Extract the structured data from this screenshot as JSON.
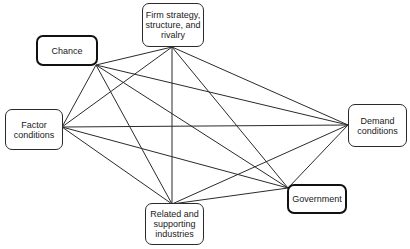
{
  "diagram": {
    "type": "network",
    "title": "",
    "nodes": [
      {
        "id": "chance",
        "label": "Chance",
        "x": 36,
        "y": 35,
        "w": 62,
        "h": 31,
        "emphasis": true
      },
      {
        "id": "firm",
        "label": "Firm strategy,\nstructure, and\nrivalry",
        "x": 142,
        "y": 3,
        "w": 62,
        "h": 44,
        "emphasis": false
      },
      {
        "id": "factor",
        "label": "Factor\nconditions",
        "x": 5,
        "y": 109,
        "w": 58,
        "h": 41,
        "emphasis": false
      },
      {
        "id": "demand",
        "label": "Demand\nconditions",
        "x": 348,
        "y": 104,
        "w": 59,
        "h": 43,
        "emphasis": false
      },
      {
        "id": "government",
        "label": "Government",
        "x": 287,
        "y": 184,
        "w": 60,
        "h": 30,
        "emphasis": true
      },
      {
        "id": "related",
        "label": "Related and\nsupporting\nindustries",
        "x": 145,
        "y": 203,
        "w": 59,
        "h": 42,
        "emphasis": false
      }
    ],
    "anchors": {
      "chance": [
        96,
        65
      ],
      "firm": [
        172,
        47
      ],
      "factor": [
        62,
        127
      ],
      "demand": [
        348,
        125
      ],
      "government": [
        288,
        188
      ],
      "related": [
        172,
        204
      ]
    },
    "edges": [
      [
        "chance",
        "firm"
      ],
      [
        "chance",
        "factor"
      ],
      [
        "chance",
        "demand"
      ],
      [
        "chance",
        "government"
      ],
      [
        "chance",
        "related"
      ],
      [
        "firm",
        "factor"
      ],
      [
        "firm",
        "demand"
      ],
      [
        "firm",
        "government"
      ],
      [
        "firm",
        "related"
      ],
      [
        "factor",
        "demand"
      ],
      [
        "factor",
        "government"
      ],
      [
        "factor",
        "related"
      ],
      [
        "demand",
        "government"
      ],
      [
        "demand",
        "related"
      ],
      [
        "government",
        "related"
      ]
    ],
    "colors": {
      "line": "#2a2a2a",
      "border": "#2a2a2a",
      "background": "#ffffff",
      "text": "#1a1a1a"
    }
  }
}
